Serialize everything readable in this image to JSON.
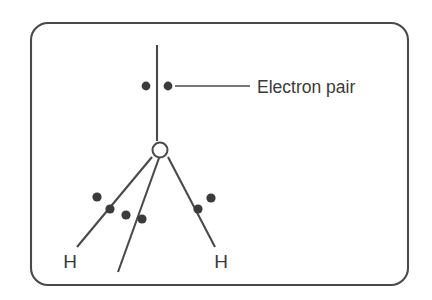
{
  "figure": {
    "background_color": "#ffffff",
    "line_color": "#4a4a4a",
    "dot_color": "#3b3b3b",
    "text_color": "#3a3a3a"
  },
  "frame": {
    "x": 31,
    "y": 23,
    "width": 377,
    "height": 262,
    "corner_radius": 17
  },
  "atoms": [
    {
      "id": "oxygen",
      "symbol": "O",
      "shape": "circle-outline",
      "cx": 160,
      "cy": 150,
      "r": 7.5
    },
    {
      "id": "hydrogen-left",
      "symbol": "H",
      "shape": "text",
      "x": 70,
      "y": 268
    },
    {
      "id": "hydrogen-right",
      "symbol": "H",
      "shape": "text",
      "x": 221,
      "y": 268
    }
  ],
  "bonds": [
    {
      "id": "bond-o-h-left",
      "x1": 152,
      "y1": 157,
      "x2": 77,
      "y2": 247
    },
    {
      "id": "bond-o-h-right",
      "x1": 168,
      "y1": 157,
      "x2": 215,
      "y2": 247
    },
    {
      "id": "lone-pair-bond-lower",
      "x1": 159,
      "y1": 158,
      "x2": 118,
      "y2": 272
    }
  ],
  "lone_pair_axis": {
    "id": "lone-pair-axis-upper",
    "x1": 157,
    "y1": 45,
    "x2": 157,
    "y2": 141
  },
  "electron_dots": [
    {
      "id": "lone-pair-top-left",
      "cx": 146,
      "cy": 86,
      "r": 4.4,
      "group": "top-lone-pair"
    },
    {
      "id": "lone-pair-top-right",
      "cx": 168,
      "cy": 86,
      "r": 4.4,
      "group": "top-lone-pair"
    },
    {
      "id": "bond-pair-left-outer",
      "cx": 97,
      "cy": 197,
      "r": 4.6,
      "group": "left-bond-pair"
    },
    {
      "id": "bond-pair-left-inner",
      "cx": 110,
      "cy": 209,
      "r": 4.6,
      "group": "left-bond-pair"
    },
    {
      "id": "lone-pair-lower-left",
      "cx": 126,
      "cy": 215,
      "r": 4.6,
      "group": "lower-lone-pair"
    },
    {
      "id": "lone-pair-lower-right",
      "cx": 142,
      "cy": 219,
      "r": 4.6,
      "group": "lower-lone-pair"
    },
    {
      "id": "bond-pair-right-inner",
      "cx": 198,
      "cy": 209,
      "r": 4.6,
      "group": "right-bond-pair"
    },
    {
      "id": "bond-pair-right-outer",
      "cx": 211,
      "cy": 198,
      "r": 4.6,
      "group": "right-bond-pair"
    }
  ],
  "callout": {
    "label": "Electron pair",
    "leader": {
      "x1": 175,
      "y1": 86,
      "x2": 250,
      "y2": 86
    },
    "text_x": 257,
    "text_y": 93
  }
}
